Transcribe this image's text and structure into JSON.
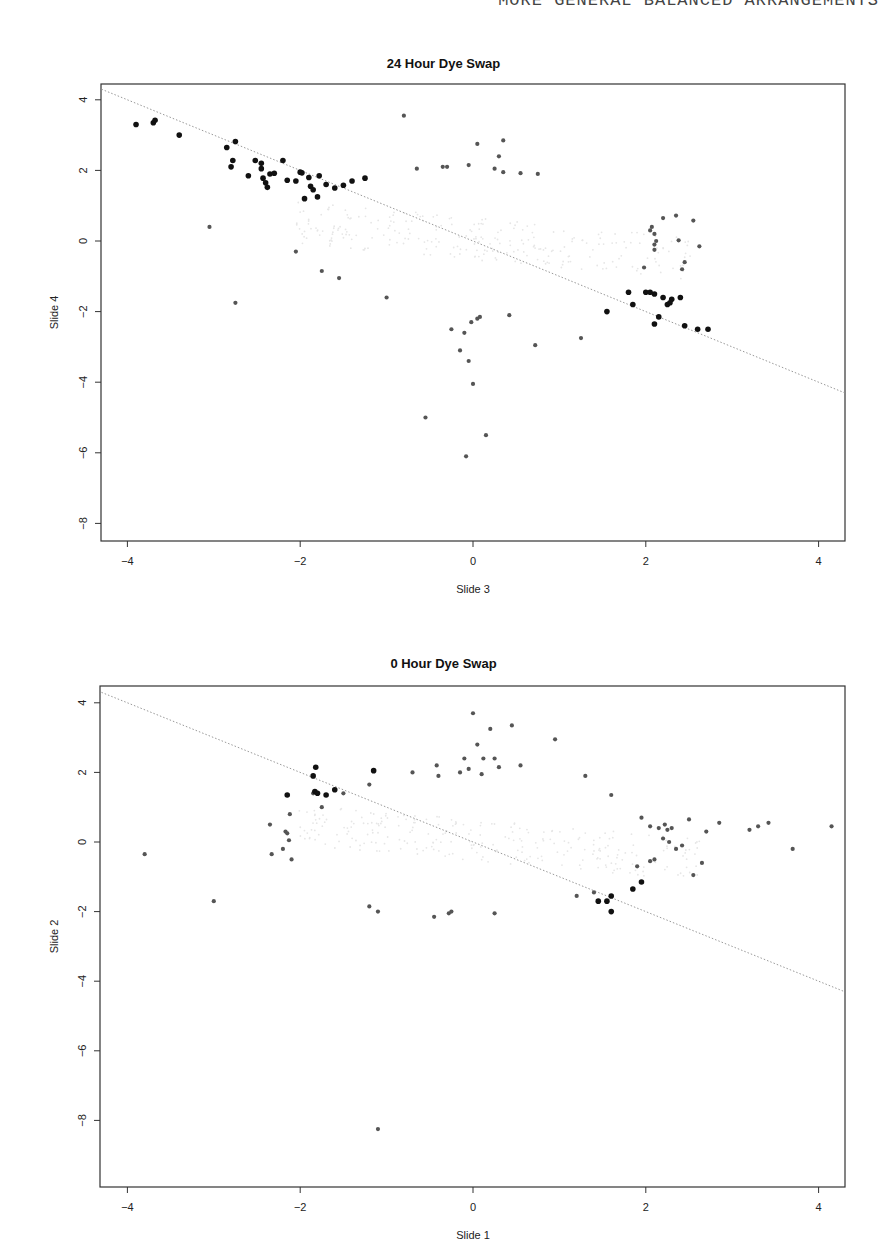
{
  "page": {
    "running_head_page": "",
    "running_head_title": "MORE GENERAL BALANCED ARRANGEMENTS"
  },
  "chart_data": [
    {
      "type": "scatter",
      "title": "24 Hour Dye Swap",
      "xlabel": "Slide 3",
      "ylabel": "Slide 4",
      "xlim": [
        -4.3,
        4.3
      ],
      "ylim": [
        -8.5,
        4.4
      ],
      "xticks": [
        -4,
        -2,
        0,
        2,
        4
      ],
      "yticks": [
        4,
        2,
        0,
        -2,
        -4,
        -6,
        -8
      ],
      "grid": false,
      "reference_line": {
        "style": "dotted",
        "slope": -1,
        "intercept": 0
      },
      "series": [
        {
          "name": "highlighted (black)",
          "color": "#111111",
          "points": [
            [
              -3.9,
              3.3
            ],
            [
              -3.7,
              3.35
            ],
            [
              -3.68,
              3.42
            ],
            [
              -3.4,
              3.0
            ],
            [
              -2.85,
              2.65
            ],
            [
              -2.75,
              2.82
            ],
            [
              -2.8,
              2.1
            ],
            [
              -2.78,
              2.28
            ],
            [
              -2.6,
              1.85
            ],
            [
              -2.52,
              2.28
            ],
            [
              -2.45,
              2.2
            ],
            [
              -2.45,
              2.05
            ],
            [
              -2.43,
              1.78
            ],
            [
              -2.4,
              1.65
            ],
            [
              -2.38,
              1.52
            ],
            [
              -2.35,
              1.9
            ],
            [
              -2.3,
              1.92
            ],
            [
              -2.2,
              2.28
            ],
            [
              -2.15,
              1.72
            ],
            [
              -2.05,
              1.7
            ],
            [
              -2.0,
              1.95
            ],
            [
              -1.98,
              1.93
            ],
            [
              -1.95,
              1.2
            ],
            [
              -1.9,
              1.8
            ],
            [
              -1.88,
              1.55
            ],
            [
              -1.85,
              1.45
            ],
            [
              -1.8,
              1.25
            ],
            [
              -1.78,
              1.85
            ],
            [
              -1.7,
              1.6
            ],
            [
              -1.6,
              1.5
            ],
            [
              -1.5,
              1.58
            ],
            [
              -1.4,
              1.7
            ],
            [
              -1.25,
              1.78
            ],
            [
              1.55,
              -2.0
            ],
            [
              1.8,
              -1.45
            ],
            [
              1.85,
              -1.8
            ],
            [
              2.0,
              -1.45
            ],
            [
              2.05,
              -1.45
            ],
            [
              2.1,
              -1.5
            ],
            [
              2.1,
              -2.35
            ],
            [
              2.15,
              -2.15
            ],
            [
              2.2,
              -1.6
            ],
            [
              2.25,
              -1.8
            ],
            [
              2.28,
              -1.75
            ],
            [
              2.3,
              -1.65
            ],
            [
              2.4,
              -1.6
            ],
            [
              2.45,
              -2.4
            ],
            [
              2.6,
              -2.5
            ],
            [
              2.72,
              -2.5
            ]
          ]
        },
        {
          "name": "gray points",
          "color": "#555555",
          "points": [
            [
              -3.05,
              0.4
            ],
            [
              -2.75,
              -1.75
            ],
            [
              -2.05,
              -0.3
            ],
            [
              -1.75,
              -0.85
            ],
            [
              -1.55,
              -1.05
            ],
            [
              -1.0,
              -1.6
            ],
            [
              -0.8,
              3.55
            ],
            [
              -0.65,
              2.05
            ],
            [
              -0.35,
              2.1
            ],
            [
              -0.3,
              2.1
            ],
            [
              -0.05,
              2.15
            ],
            [
              0.05,
              2.75
            ],
            [
              0.25,
              2.05
            ],
            [
              0.3,
              2.4
            ],
            [
              0.35,
              2.85
            ],
            [
              0.35,
              1.95
            ],
            [
              0.55,
              1.92
            ],
            [
              0.75,
              1.9
            ],
            [
              -0.25,
              -2.5
            ],
            [
              -0.15,
              -3.1
            ],
            [
              -0.1,
              -2.6
            ],
            [
              -0.05,
              -3.4
            ],
            [
              -0.02,
              -2.3
            ],
            [
              0.0,
              -4.05
            ],
            [
              0.05,
              -2.2
            ],
            [
              0.08,
              -2.15
            ],
            [
              0.15,
              -5.5
            ],
            [
              -0.08,
              -6.1
            ],
            [
              -0.55,
              -5.0
            ],
            [
              0.42,
              -2.1
            ],
            [
              0.72,
              -2.95
            ],
            [
              1.25,
              -2.75
            ],
            [
              1.98,
              -0.75
            ],
            [
              2.05,
              0.3
            ],
            [
              2.07,
              0.4
            ],
            [
              2.1,
              -0.1
            ],
            [
              2.1,
              -0.25
            ],
            [
              2.1,
              0.2
            ],
            [
              2.12,
              0.0
            ],
            [
              2.2,
              0.65
            ],
            [
              2.35,
              0.72
            ],
            [
              2.38,
              0.02
            ],
            [
              2.42,
              -0.8
            ],
            [
              2.45,
              -0.6
            ],
            [
              2.55,
              0.58
            ],
            [
              2.62,
              -0.15
            ]
          ]
        }
      ]
    },
    {
      "type": "scatter",
      "title": "0 Hour Dye Swap",
      "xlabel": "Slide 1",
      "ylabel": "Slide 2",
      "xlim": [
        -4.3,
        4.3
      ],
      "ylim": [
        -8.5,
        4.4
      ],
      "xticks": [
        -4,
        -2,
        0,
        2,
        4
      ],
      "yticks": [
        4,
        2,
        0,
        -2,
        -4,
        -6,
        -8
      ],
      "grid": false,
      "reference_line": {
        "style": "dotted",
        "slope": -1,
        "intercept": 0
      },
      "series": [
        {
          "name": "highlighted (black)",
          "color": "#111111",
          "points": [
            [
              -2.15,
              1.35
            ],
            [
              -1.85,
              1.9
            ],
            [
              -1.83,
              1.45
            ],
            [
              -1.82,
              2.15
            ],
            [
              -1.8,
              1.4
            ],
            [
              -1.7,
              1.35
            ],
            [
              -1.6,
              1.5
            ],
            [
              -1.15,
              2.05
            ],
            [
              1.45,
              -1.7
            ],
            [
              1.55,
              -1.7
            ],
            [
              1.6,
              -1.55
            ],
            [
              1.6,
              -2.0
            ],
            [
              1.85,
              -1.35
            ],
            [
              1.95,
              -1.15
            ]
          ]
        },
        {
          "name": "gray points",
          "color": "#555555",
          "points": [
            [
              -3.8,
              -0.35
            ],
            [
              -3.0,
              -1.7
            ],
            [
              -2.35,
              0.5
            ],
            [
              -2.33,
              -0.35
            ],
            [
              -2.2,
              -0.2
            ],
            [
              -2.17,
              0.3
            ],
            [
              -2.15,
              0.25
            ],
            [
              -2.13,
              0.05
            ],
            [
              -2.12,
              0.8
            ],
            [
              -2.1,
              -0.5
            ],
            [
              -1.85,
              1.4
            ],
            [
              -1.75,
              1.0
            ],
            [
              -1.5,
              1.4
            ],
            [
              -1.2,
              1.65
            ],
            [
              -0.7,
              2.0
            ],
            [
              -0.42,
              2.2
            ],
            [
              -0.4,
              1.9
            ],
            [
              -0.15,
              2.0
            ],
            [
              -0.1,
              2.4
            ],
            [
              -0.05,
              2.1
            ],
            [
              0.0,
              3.7
            ],
            [
              0.05,
              2.8
            ],
            [
              0.1,
              1.95
            ],
            [
              0.12,
              2.4
            ],
            [
              0.2,
              3.25
            ],
            [
              0.25,
              2.4
            ],
            [
              0.3,
              2.15
            ],
            [
              0.45,
              3.35
            ],
            [
              0.55,
              2.2
            ],
            [
              0.95,
              2.95
            ],
            [
              -1.2,
              -1.85
            ],
            [
              -1.1,
              -2.0
            ],
            [
              -0.45,
              -2.15
            ],
            [
              -0.28,
              -2.05
            ],
            [
              -0.25,
              -2.0
            ],
            [
              0.25,
              -2.05
            ],
            [
              -1.1,
              -8.25
            ],
            [
              1.2,
              -1.55
            ],
            [
              1.3,
              1.9
            ],
            [
              1.4,
              -1.45
            ],
            [
              1.6,
              1.35
            ],
            [
              1.9,
              -0.7
            ],
            [
              1.95,
              0.7
            ],
            [
              2.05,
              -0.55
            ],
            [
              2.05,
              0.45
            ],
            [
              2.1,
              -0.5
            ],
            [
              2.15,
              0.4
            ],
            [
              2.2,
              0.1
            ],
            [
              2.22,
              0.5
            ],
            [
              2.25,
              0.35
            ],
            [
              2.27,
              0.0
            ],
            [
              2.3,
              0.4
            ],
            [
              2.35,
              -0.2
            ],
            [
              2.42,
              -0.1
            ],
            [
              2.5,
              0.65
            ],
            [
              2.55,
              -0.95
            ],
            [
              2.65,
              -0.6
            ],
            [
              2.7,
              0.3
            ],
            [
              2.85,
              0.55
            ],
            [
              3.2,
              0.35
            ],
            [
              3.3,
              0.45
            ],
            [
              3.42,
              0.55
            ],
            [
              3.7,
              -0.2
            ],
            [
              4.15,
              0.45
            ]
          ]
        }
      ]
    }
  ]
}
